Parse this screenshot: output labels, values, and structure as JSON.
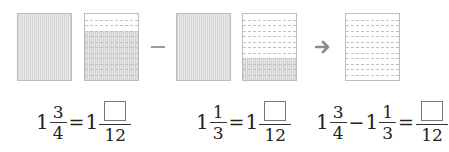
{
  "diagram": {
    "models": [
      {
        "id": "m1",
        "fill": "full",
        "rows": 0
      },
      {
        "id": "m2",
        "fill": "partial",
        "rows": 12,
        "shaded_rows": 9
      },
      {
        "id": "m3",
        "fill": "full",
        "rows": 0
      },
      {
        "id": "m4",
        "fill": "partial",
        "rows": 12,
        "shaded_rows": 4
      },
      {
        "id": "m5",
        "fill": "empty",
        "rows": 12,
        "shaded_rows": 0
      }
    ],
    "operator": "minus",
    "arrow": "right-arrow"
  },
  "equations": [
    {
      "whole": "1",
      "num": "3",
      "den": "4",
      "equals": "=",
      "whole2": "1",
      "den2": "12"
    },
    {
      "whole": "1",
      "num": "1",
      "den": "3",
      "equals": "=",
      "whole2": "1",
      "den2": "12"
    },
    {
      "whole_a": "1",
      "num_a": "3",
      "den_a": "4",
      "minus": "−",
      "whole_b": "1",
      "num_b": "1",
      "den_b": "3",
      "equals": "=",
      "den_r": "12"
    }
  ]
}
